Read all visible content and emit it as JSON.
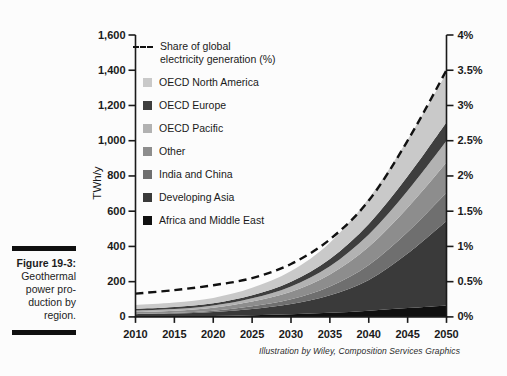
{
  "figure": {
    "label": "Figure 19-3:",
    "caption_lines": [
      "Geothermal",
      "power pro-",
      "duction by",
      "region."
    ]
  },
  "attribution": "Illustration by Wiley, Composition Services Graphics",
  "colors": {
    "axis": "#1a1a1a",
    "background": "#fcfcfc",
    "dashed_line": "#111111"
  },
  "chart_data": {
    "type": "area",
    "stacked": true,
    "x": [
      2010,
      2015,
      2020,
      2025,
      2030,
      2035,
      2040,
      2045,
      2050
    ],
    "x_tick_labels": [
      "2010",
      "2015",
      "2020",
      "2025",
      "2030",
      "2035",
      "2040",
      "2045",
      "2050"
    ],
    "left_axis": {
      "label": "TWh/y",
      "min": 0,
      "max": 1600,
      "step": 200,
      "tick_labels": [
        "0",
        "200",
        "400",
        "600",
        "800",
        "1,000",
        "1,200",
        "1,400",
        "1,600"
      ]
    },
    "right_axis": {
      "min": 0,
      "max": 4,
      "step": 0.5,
      "tick_labels": [
        "0%",
        "0.5%",
        "1%",
        "1.5%",
        "2%",
        "2.5%",
        "3%",
        "3.5%",
        "4%"
      ]
    },
    "line_series": {
      "name": "Share of global electricity generation (%)",
      "legend_lines": [
        "Share of global",
        "electricity generation (%)"
      ],
      "axis": "right",
      "style": "dashed",
      "color": "#111111",
      "values": [
        0.33,
        0.38,
        0.45,
        0.55,
        0.75,
        1.1,
        1.65,
        2.5,
        3.5
      ]
    },
    "series": [
      {
        "name": "OECD North America",
        "color": "#c9c9c9",
        "values": [
          22,
          25,
          30,
          42,
          60,
          92,
          145,
          208,
          280
        ]
      },
      {
        "name": "OECD Europe",
        "color": "#3e3e3e",
        "values": [
          10,
          11,
          13,
          17,
          27,
          41,
          60,
          82,
          105
        ]
      },
      {
        "name": "OECD Pacific",
        "color": "#b2b2b2",
        "values": [
          9,
          10,
          13,
          19,
          30,
          47,
          70,
          96,
          123
        ]
      },
      {
        "name": "Other",
        "color": "#8d8d8d",
        "values": [
          10,
          12,
          17,
          27,
          43,
          68,
          103,
          138,
          172
        ]
      },
      {
        "name": "India and China",
        "color": "#6f6f6f",
        "values": [
          2,
          4,
          8,
          15,
          27,
          50,
          85,
          122,
          160
        ]
      },
      {
        "name": "Developing Asia",
        "color": "#3a3a3a",
        "values": [
          13,
          16,
          22,
          36,
          58,
          100,
          175,
          310,
          480
        ]
      },
      {
        "name": "Africa and Middle East",
        "color": "#101010",
        "values": [
          2,
          3,
          5,
          9,
          15,
          23,
          35,
          50,
          65
        ]
      }
    ]
  }
}
